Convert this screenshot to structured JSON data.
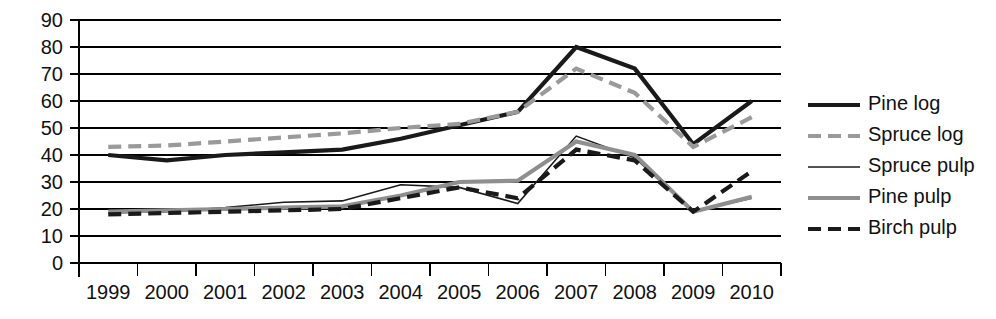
{
  "chart_data": {
    "type": "line",
    "title": "",
    "subtitle": "",
    "xlabel": "",
    "ylabel": "",
    "categories": [
      "1999",
      "2000",
      "2001",
      "2002",
      "2003",
      "2004",
      "2005",
      "2006",
      "2007",
      "2008",
      "2009",
      "2010"
    ],
    "x": [
      1999,
      2000,
      2001,
      2002,
      2003,
      2004,
      2005,
      2006,
      2007,
      2008,
      2009,
      2010
    ],
    "ylim": [
      0,
      90
    ],
    "yticks": [
      0,
      10,
      20,
      30,
      40,
      50,
      60,
      70,
      80,
      90
    ],
    "ytick_labels": [
      "0",
      "10",
      "20",
      "30",
      "40",
      "50",
      "60",
      "70",
      "80",
      "90"
    ],
    "grid": true,
    "legend_position": "right",
    "series": [
      {
        "name": "Pine log",
        "values": [
          40,
          38,
          40,
          41,
          42,
          46,
          51,
          56,
          80,
          72,
          44,
          60
        ],
        "color": "#1a1a1a",
        "style": "solid",
        "width": 4.2
      },
      {
        "name": "Spruce log",
        "values": [
          43,
          43.5,
          45,
          46.5,
          48,
          50,
          51.5,
          56,
          72,
          63,
          43,
          54
        ],
        "color": "#9a9a9a",
        "style": "dashed",
        "width": 4.2
      },
      {
        "name": "Spruce pulp",
        "values": [
          18.5,
          19,
          20.5,
          22.5,
          23,
          29,
          28,
          22,
          47,
          39,
          19,
          24
        ],
        "color": "#1a1a1a",
        "style": "solid",
        "width": 1.6
      },
      {
        "name": "Pine pulp",
        "values": [
          19,
          19.5,
          20,
          20.5,
          21,
          25,
          30,
          30.5,
          45,
          40,
          19,
          24.5
        ],
        "color": "#8f8f8f",
        "style": "solid",
        "width": 4.2
      },
      {
        "name": "Birch pulp",
        "values": [
          18,
          18.5,
          19,
          19.5,
          20,
          24,
          28,
          24,
          42,
          38,
          19,
          34
        ],
        "color": "#1a1a1a",
        "style": "dashed",
        "width": 4.2
      }
    ]
  },
  "legend": {
    "items": [
      {
        "label": "Pine log"
      },
      {
        "label": "Spruce log"
      },
      {
        "label": "Spruce pulp"
      },
      {
        "label": "Pine pulp"
      },
      {
        "label": "Birch pulp"
      }
    ]
  }
}
